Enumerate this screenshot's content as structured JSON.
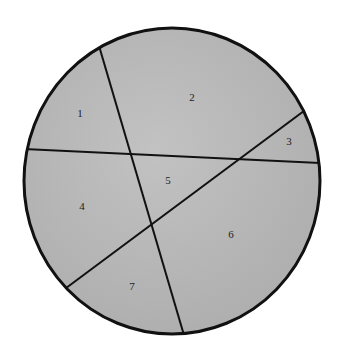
{
  "diagram": {
    "fill_color": "#b4b4b4",
    "stroke_color": "#111111",
    "regions": [
      {
        "label": "1"
      },
      {
        "label": "2"
      },
      {
        "label": "3"
      },
      {
        "label": "4"
      },
      {
        "label": "5"
      },
      {
        "label": "6"
      },
      {
        "label": "7"
      }
    ]
  }
}
